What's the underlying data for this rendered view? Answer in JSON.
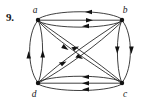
{
  "problem": {
    "number": "9."
  },
  "graph": {
    "kind": "directed-multigraph",
    "nodes": [
      {
        "id": "a",
        "label": "a",
        "x": 38,
        "y": 20,
        "label_x": 35,
        "label_y": 13
      },
      {
        "id": "b",
        "label": "b",
        "x": 122,
        "y": 20,
        "label_x": 124,
        "label_y": 13
      },
      {
        "id": "c",
        "label": "c",
        "x": 122,
        "y": 83,
        "label_x": 124,
        "label_y": 96
      },
      {
        "id": "d",
        "label": "d",
        "x": 38,
        "y": 83,
        "label_x": 34,
        "label_y": 96
      }
    ],
    "edges": [
      {
        "from": "b",
        "to": "a",
        "style": "curve-up",
        "note": "top outer arc, arrow at a"
      },
      {
        "from": "a",
        "to": "b",
        "style": "straight",
        "note": "middle line, arrow at b"
      },
      {
        "from": "b",
        "to": "a",
        "style": "curve-down",
        "note": "lower arc, arrow at a"
      },
      {
        "from": "c",
        "to": "d",
        "style": "curve-up",
        "note": "upper arc, arrow at d"
      },
      {
        "from": "c",
        "to": "d",
        "style": "straight",
        "note": "middle line, arrow at d"
      },
      {
        "from": "c",
        "to": "d",
        "style": "curve-down",
        "note": "lower arc, arrow at d"
      },
      {
        "from": "d",
        "to": "a",
        "style": "curve-left",
        "note": "left outer arc, arrow at a"
      },
      {
        "from": "d",
        "to": "a",
        "style": "curve-right",
        "note": "left inner arc, arrow at a"
      },
      {
        "from": "b",
        "to": "c",
        "style": "curve-left",
        "note": "right inner arc, arrow at c"
      },
      {
        "from": "b",
        "to": "c",
        "style": "curve-right",
        "note": "right outer arc, arrow at c"
      },
      {
        "from": "d",
        "to": "b",
        "style": "diagonal",
        "note": "diagonal up-right, arrow toward b"
      },
      {
        "from": "d",
        "to": "b",
        "style": "diagonal-2",
        "note": "second diagonal up-right, arrow toward b"
      },
      {
        "from": "a",
        "to": "c",
        "style": "diagonal",
        "note": "diagonal down-right, arrow toward c"
      },
      {
        "from": "a",
        "to": "c",
        "style": "diagonal-2",
        "note": "second diagonal down-right, arrow toward c"
      }
    ],
    "colors": {
      "stroke": "#1d1d1d",
      "vertex": "#111111",
      "label": "#1a1a1a",
      "background": "#ffffff"
    },
    "counts": {
      "vertices": 4,
      "edges": 14
    }
  }
}
